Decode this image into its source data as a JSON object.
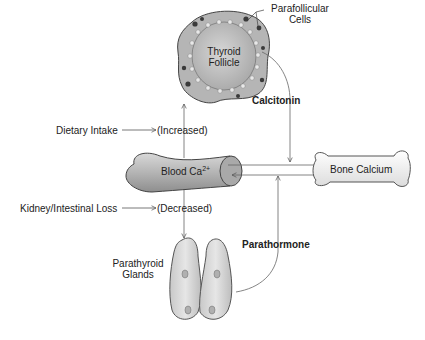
{
  "diagram": {
    "nodes": {
      "thyroid": {
        "label_line1": "Thyroid",
        "label_line2": "Follicle"
      },
      "parafollicular": {
        "label_line1": "Parafollicular",
        "label_line2": "Cells"
      },
      "blood": {
        "label": "Blood Ca",
        "superscript": "2+"
      },
      "bone": {
        "label": "Bone Calcium"
      },
      "parathyroid": {
        "label_line1": "Parathyroid",
        "label_line2": "Glands"
      }
    },
    "hormones": {
      "calcitonin": "Calcitonin",
      "parathormone": "Parathormone"
    },
    "inputs": {
      "dietary": {
        "source": "Dietary Intake",
        "effect": "(Increased)"
      },
      "loss": {
        "source": "Kidney/Intestinal Loss",
        "effect": "(Decreased)"
      }
    },
    "colors": {
      "organ_fill": "#b8b8b8",
      "organ_light": "#e4e4e4",
      "outline": "#444444",
      "line": "#555555",
      "cell_dark": "#3a3a3a"
    }
  }
}
